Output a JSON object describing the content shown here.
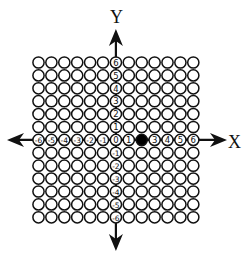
{
  "diagram": {
    "type": "coordinate-grid",
    "axes": {
      "x_label": "X",
      "y_label": "Y"
    },
    "grid": {
      "columns": 13,
      "rows": 13,
      "x_range": [
        -6,
        6
      ],
      "y_range": [
        -6,
        6
      ]
    },
    "x_tick_labels": [
      "-6",
      "-5",
      "-4",
      "-3",
      "-2",
      "-1",
      "0",
      "1",
      "2",
      "3",
      "4",
      "5",
      "6"
    ],
    "y_tick_labels": [
      "6",
      "5",
      "4",
      "3",
      "2",
      "1",
      "0",
      "-1",
      "-2",
      "-3",
      "-4",
      "-5",
      "-6"
    ],
    "highlighted_point": {
      "x": 2,
      "y": 0,
      "color": "#000000"
    },
    "colors": {
      "ink": "#111111",
      "background": "#ffffff"
    }
  }
}
